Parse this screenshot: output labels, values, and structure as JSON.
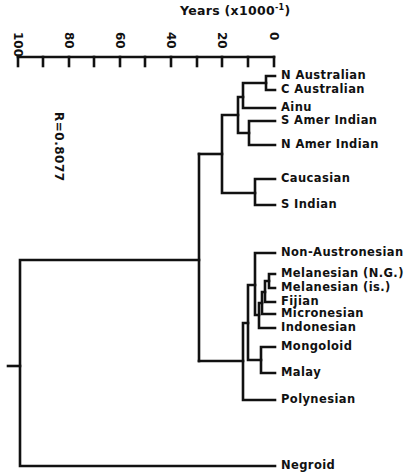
{
  "axis": {
    "title": "Years (x1000",
    "title_sup": "-1",
    "title_close": ")",
    "ticks": [
      {
        "label": "100",
        "x": 18
      },
      {
        "label": "80",
        "x": 69
      },
      {
        "label": "60",
        "x": 120
      },
      {
        "label": "40",
        "x": 171
      },
      {
        "label": "20",
        "x": 222
      },
      {
        "label": "0",
        "x": 274
      }
    ],
    "minor_ticks_x": [
      43,
      94,
      145,
      197,
      248
    ]
  },
  "correlation": "R=0.8077",
  "leaves": [
    {
      "label": "N Australian",
      "y": 76
    },
    {
      "label": "C Australian",
      "y": 90
    },
    {
      "label": "Ainu",
      "y": 108
    },
    {
      "label": "S Amer Indian",
      "y": 121
    },
    {
      "label": "N Amer Indian",
      "y": 145
    },
    {
      "label": "Caucasian",
      "y": 179
    },
    {
      "label": "S Indian",
      "y": 205
    },
    {
      "label": "Non-Austronesian",
      "y": 253
    },
    {
      "label": "Melanesian (N.G.)",
      "y": 274
    },
    {
      "label": "Melanesian (is.)",
      "y": 288
    },
    {
      "label": "Fijian",
      "y": 302
    },
    {
      "label": "Micronesian",
      "y": 314
    },
    {
      "label": "Indonesian",
      "y": 328
    },
    {
      "label": "Mongoloid",
      "y": 347
    },
    {
      "label": "Malay",
      "y": 373
    },
    {
      "label": "Polynesian",
      "y": 400
    },
    {
      "label": "Negroid",
      "y": 466
    }
  ],
  "chart_data": {
    "type": "dendrogram",
    "title": "",
    "xlabel": "Years (x1000^-1)",
    "xlim": [
      100,
      0
    ],
    "annotation": "R=0.8077",
    "leaves": [
      "N Australian",
      "C Australian",
      "Ainu",
      "S Amer Indian",
      "N Amer Indian",
      "Caucasian",
      "S Indian",
      "Non-Austronesian",
      "Melanesian (N.G.)",
      "Melanesian (is.)",
      "Fijian",
      "Micronesian",
      "Indonesian",
      "Mongoloid",
      "Malay",
      "Polynesian",
      "Negroid"
    ],
    "merges": [
      {
        "members": [
          "N Australian",
          "C Australian"
        ],
        "height": 3
      },
      {
        "members": [
          "(N Australian, C Australian)",
          "Ainu"
        ],
        "height": 12
      },
      {
        "members": [
          "S Amer Indian",
          "N Amer Indian"
        ],
        "height": 10
      },
      {
        "members": [
          "(Australians, Ainu)",
          "(Amer Indians)"
        ],
        "height": 14
      },
      {
        "members": [
          "Caucasian",
          "S Indian"
        ],
        "height": 7
      },
      {
        "members": [
          "(Australians, Ainu, Amer Indians)",
          "(Caucasian, S Indian)"
        ],
        "height": 20
      },
      {
        "members": [
          "Melanesian (N.G.)",
          "Melanesian (is.)"
        ],
        "height": 2
      },
      {
        "members": [
          "(Melanesians)",
          "Fijian"
        ],
        "height": 3.5
      },
      {
        "members": [
          "(Melanesians, Fijian)",
          "Micronesian"
        ],
        "height": 5
      },
      {
        "members": [
          "(..., Micronesian)",
          "Indonesian"
        ],
        "height": 6
      },
      {
        "members": [
          "Non-Austronesian",
          "(Austronesian cluster)"
        ],
        "height": 7.5
      },
      {
        "members": [
          "Mongoloid",
          "Malay"
        ],
        "height": 5.5
      },
      {
        "members": [
          "(Non-Austronesian cluster)",
          "(Mongoloid, Malay)"
        ],
        "height": 10
      },
      {
        "members": [
          "(...)",
          "Polynesian"
        ],
        "height": 12
      },
      {
        "members": [
          "(upper cluster)",
          "(lower cluster)"
        ],
        "height": 29
      },
      {
        "members": [
          "(all others)",
          "Negroid"
        ],
        "height": 99
      }
    ]
  }
}
